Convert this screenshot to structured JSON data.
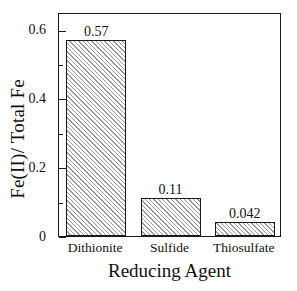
{
  "chart_data": {
    "type": "bar",
    "title": "",
    "subtitle": "",
    "xlabel": "Reducing Agent",
    "ylabel": "Fe(II)/ Total Fe",
    "categories": [
      "Dithionite",
      "Sulfide",
      "Thiosulfate"
    ],
    "values": [
      0.57,
      0.11,
      0.042
    ],
    "value_labels": [
      "0.57",
      "0.11",
      "0.042"
    ],
    "ylim": [
      0,
      0.65
    ],
    "xlim": [
      0,
      3
    ],
    "y_major_ticks": [
      0,
      0.2,
      0.4,
      0.6
    ],
    "y_major_tick_labels": [
      "0",
      "0.2",
      "0.4",
      "0.6"
    ],
    "y_minor_ticks": [
      0.1,
      0.3,
      0.5
    ],
    "grid": false,
    "legend": null,
    "legend_position": "none",
    "bar_fill": "diagonal-hatch",
    "bar_edge_color": "#1a1a1a",
    "hatch_color": "#9a9a9a",
    "background_color": "#ffffff",
    "frame": "full-box",
    "annotations": []
  },
  "axes": {
    "y_ticks": [
      {
        "value": 0.6,
        "label": "0.6",
        "major": true
      },
      {
        "value": 0.5,
        "label": "",
        "major": false
      },
      {
        "value": 0.4,
        "label": "0.4",
        "major": true
      },
      {
        "value": 0.3,
        "label": "",
        "major": false
      },
      {
        "value": 0.2,
        "label": "0.2",
        "major": true
      },
      {
        "value": 0.1,
        "label": "",
        "major": false
      },
      {
        "value": 0.0,
        "label": "0",
        "major": true
      }
    ]
  },
  "bars": [
    {
      "category": "Dithionite",
      "value": 0.57,
      "label": "0.57"
    },
    {
      "category": "Sulfide",
      "value": 0.11,
      "label": "0.11"
    },
    {
      "category": "Thiosulfate",
      "value": 0.042,
      "label": "0.042"
    }
  ]
}
